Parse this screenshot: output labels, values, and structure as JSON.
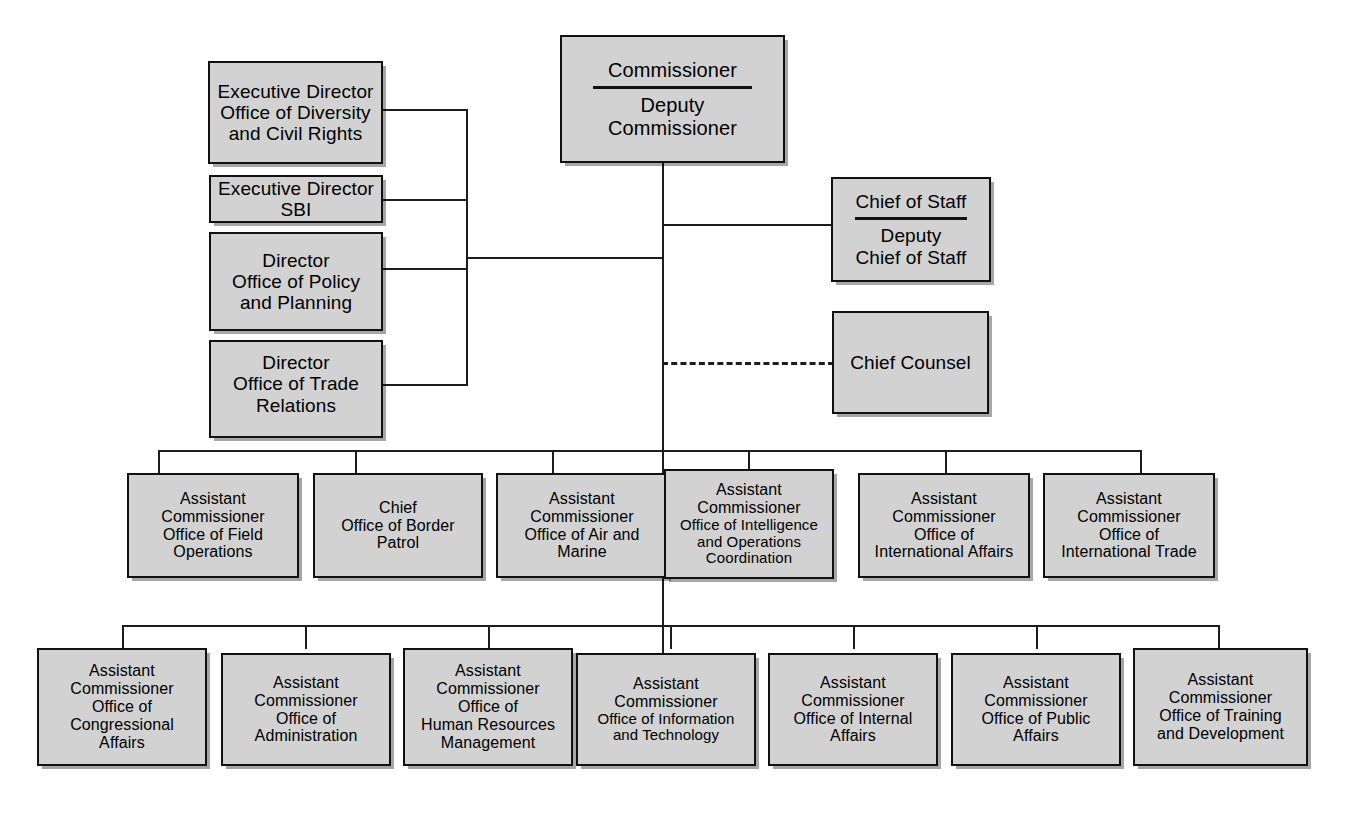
{
  "chart_title": "U.S. Customs and Border Protection Organization Chart",
  "style": {
    "box_fill": "#d2d2d2",
    "box_border": "#111111",
    "line_color": "#1d1d1d",
    "background": "#ffffff"
  },
  "top": {
    "commissioner": "Commissioner",
    "deputy_commissioner": "Deputy\nCommissioner",
    "deputy_line1": "Deputy",
    "deputy_line2": "Commissioner"
  },
  "left_column": [
    {
      "name": "executive-director-diversity",
      "line1": "Executive Director",
      "line2": "Office of Diversity",
      "line3": "and Civil Rights"
    },
    {
      "name": "executive-director-sbi",
      "line1": "Executive Director",
      "line2": "SBI",
      "line3": ""
    },
    {
      "name": "director-policy-planning",
      "line1": "Director",
      "line2": "Office of Policy",
      "line3": "and Planning"
    },
    {
      "name": "director-trade-relations",
      "line1": "Director",
      "line2": "Office of Trade",
      "line3": "Relations"
    }
  ],
  "right_column": {
    "chief_of_staff": "Chief of Staff",
    "deputy_chief_of_staff_line1": "Deputy",
    "deputy_chief_of_staff_line2": "Chief of Staff",
    "chief_counsel": "Chief Counsel"
  },
  "row1": [
    {
      "name": "office-of-field-operations",
      "line1": "Assistant",
      "line2": "Commissioner",
      "line3": "Office of Field",
      "line4": "Operations"
    },
    {
      "name": "office-of-border-patrol",
      "line1": "Chief",
      "line2": "Office of Border",
      "line3": "Patrol",
      "line4": ""
    },
    {
      "name": "office-of-air-and-marine",
      "line1": "Assistant",
      "line2": "Commissioner",
      "line3": "Office of Air and",
      "line4": "Marine"
    },
    {
      "name": "office-of-intelligence-and-operations-coordination",
      "line1": "Assistant",
      "line2": "Commissioner",
      "line3": "Office of Intelligence",
      "line4": "and Operations",
      "line5": "Coordination"
    },
    {
      "name": "office-of-international-affairs",
      "line1": "Assistant",
      "line2": "Commissioner",
      "line3": "Office of",
      "line4": "International Affairs"
    },
    {
      "name": "office-of-international-trade",
      "line1": "Assistant",
      "line2": "Commissioner",
      "line3": "Office of",
      "line4": "International Trade"
    }
  ],
  "row2": [
    {
      "name": "office-of-congressional-affairs",
      "line1": "Assistant",
      "line2": "Commissioner",
      "line3": "Office of",
      "line4": "Congressional",
      "line5": "Affairs"
    },
    {
      "name": "office-of-administration",
      "line1": "Assistant",
      "line2": "Commissioner",
      "line3": "Office of",
      "line4": "Administration",
      "line5": ""
    },
    {
      "name": "office-of-human-resources-management",
      "line1": "Assistant",
      "line2": "Commissioner",
      "line3": "Office of",
      "line4": "Human Resources",
      "line5": "Management"
    },
    {
      "name": "office-of-information-and-technology",
      "line1": "Assistant",
      "line2": "Commissioner",
      "line3": "Office of Information",
      "line4": "and Technology",
      "line5": ""
    },
    {
      "name": "office-of-internal-affairs",
      "line1": "Assistant",
      "line2": "Commissioner",
      "line3": "Office of Internal",
      "line4": "Affairs",
      "line5": ""
    },
    {
      "name": "office-of-public-affairs",
      "line1": "Assistant",
      "line2": "Commissioner",
      "line3": "Office of Public",
      "line4": "Affairs",
      "line5": ""
    },
    {
      "name": "office-of-training-and-development",
      "line1": "Assistant",
      "line2": "Commissioner",
      "line3": "Office of Training",
      "line4": "and Development",
      "line5": ""
    }
  ]
}
